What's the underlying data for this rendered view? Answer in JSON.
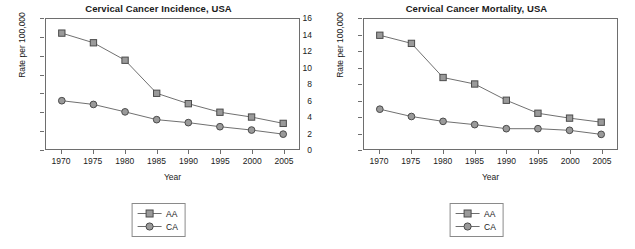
{
  "figure": {
    "axis_label_y": "Rate per 100,000",
    "axis_label_x": "Year",
    "legend": [
      {
        "key": "AA",
        "marker": "square-marker"
      },
      {
        "key": "CA",
        "marker": "circle-marker"
      }
    ],
    "colors": {
      "line": "#6e6e6e",
      "marker_fill": "#9a9a9a",
      "marker_stroke": "#4a4a4a",
      "axis": "#6e6e6e",
      "text": "#1a1a1a"
    }
  },
  "chart_data": [
    {
      "type": "line",
      "title": "Cervical Cancer Incidence, USA",
      "xlabel": "Year",
      "ylabel": "Rate per 100,000",
      "x": [
        1970,
        1975,
        1980,
        1985,
        1990,
        1995,
        2000,
        2005
      ],
      "xticklabels": [
        "1970",
        "1975",
        "1980",
        "1985",
        "1990",
        "1995",
        "2000",
        "2005"
      ],
      "yticklabels": [
        "0",
        "5",
        "10",
        "15",
        "20",
        "25",
        "30",
        "35"
      ],
      "yticks": [
        0,
        5,
        10,
        15,
        20,
        25,
        30,
        35
      ],
      "xlim": [
        1967.5,
        2007.5
      ],
      "ylim": [
        0,
        35
      ],
      "grid": false,
      "legend_position": "below-center",
      "series": [
        {
          "name": "AA",
          "marker": "square",
          "values": [
            31.2,
            28.6,
            23.9,
            15.0,
            12.2,
            9.9,
            8.6,
            6.9
          ]
        },
        {
          "name": "CA",
          "marker": "circle",
          "values": [
            13.0,
            12.0,
            10.0,
            7.9,
            7.1,
            6.0,
            5.1,
            4.0
          ]
        }
      ]
    },
    {
      "type": "line",
      "title": "Cervical Cancer Mortality, USA",
      "xlabel": "Year",
      "ylabel": "Rate per 100,000",
      "x": [
        1970,
        1975,
        1980,
        1985,
        1990,
        1995,
        2000,
        2005
      ],
      "xticklabels": [
        "1970",
        "1975",
        "1980",
        "1985",
        "1990",
        "1995",
        "2000",
        "2005"
      ],
      "yticklabels": [
        "0",
        "2",
        "4",
        "6",
        "8",
        "10",
        "12",
        "14",
        "16"
      ],
      "yticks": [
        0,
        2,
        4,
        6,
        8,
        10,
        12,
        14,
        16
      ],
      "xlim": [
        1967.5,
        2007.5
      ],
      "ylim": [
        0,
        16
      ],
      "grid": false,
      "legend_position": "below-center",
      "series": [
        {
          "name": "AA",
          "marker": "square",
          "values": [
            14.0,
            13.0,
            8.8,
            8.0,
            6.0,
            4.4,
            3.8,
            3.3
          ]
        },
        {
          "name": "CA",
          "marker": "circle",
          "values": [
            4.9,
            4.0,
            3.4,
            3.0,
            2.5,
            2.5,
            2.3,
            1.8
          ]
        }
      ]
    }
  ]
}
